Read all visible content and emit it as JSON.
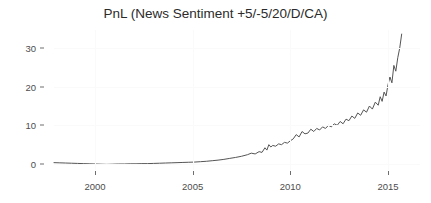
{
  "chart_data": {
    "type": "line",
    "title": "PnL (News Sentiment +5/-5/20/D/CA)",
    "xlabel": "",
    "ylabel": "",
    "xlim": [
      1997.7,
      1
    ],
    "ylim": [
      -1.5,
      35.5
    ],
    "xticks": [
      2000,
      2005,
      2010,
      2015
    ],
    "xtick_labels": [
      "2000",
      "2005",
      "2010",
      "2015"
    ],
    "yticks": [
      0,
      10,
      20,
      30
    ],
    "ytick_labels": [
      "0",
      "10",
      "20",
      "30"
    ],
    "grid": "faint",
    "legend": "none",
    "line_color": "#555555",
    "series": [
      {
        "name": "PnL",
        "x": [
          1997.9,
          1998.2,
          1998.5,
          1998.8,
          1999.1,
          1999.4,
          1999.7,
          2000.0,
          2000.3,
          2000.6,
          2000.9,
          2001.2,
          2001.5,
          2001.8,
          2002.1,
          2002.4,
          2002.7,
          2003.0,
          2003.3,
          2003.6,
          2003.9,
          2004.2,
          2004.5,
          2004.8,
          2005.1,
          2005.4,
          2005.7,
          2006.0,
          2006.3,
          2006.6,
          2006.9,
          2007.2,
          2007.5,
          2007.8,
          2008.0,
          2008.2,
          2008.4,
          2008.55,
          2008.7,
          2008.8,
          2008.9,
          2009.0,
          2009.1,
          2009.25,
          2009.4,
          2009.55,
          2009.7,
          2009.85,
          2010.0,
          2010.15,
          2010.3,
          2010.45,
          2010.6,
          2010.75,
          2010.9,
          2011.05,
          2011.2,
          2011.35,
          2011.5,
          2011.65,
          2011.8,
          2011.95,
          2012.1,
          2012.25,
          2012.4,
          2012.55,
          2012.7,
          2012.85,
          2013.0,
          2013.15,
          2013.3,
          2013.45,
          2013.6,
          2013.75,
          2013.9,
          2014.05,
          2014.2,
          2014.35,
          2014.5,
          2014.6,
          2014.7,
          2014.8,
          2014.9,
          2015.0,
          2015.1,
          2015.2,
          2015.3,
          2015.4,
          2015.5,
          2015.6,
          2015.7
        ],
        "y": [
          0.35,
          0.3,
          0.25,
          0.2,
          0.15,
          0.1,
          0.05,
          0.0,
          -0.05,
          -0.1,
          -0.05,
          0.0,
          0.0,
          0.05,
          0.05,
          0.1,
          0.1,
          0.15,
          0.2,
          0.25,
          0.3,
          0.35,
          0.4,
          0.45,
          0.5,
          0.6,
          0.7,
          0.85,
          1.0,
          1.2,
          1.45,
          1.7,
          2.0,
          2.4,
          2.8,
          2.6,
          3.2,
          3.0,
          4.2,
          3.6,
          5.0,
          4.4,
          4.8,
          4.6,
          5.2,
          5.0,
          5.6,
          5.4,
          6.0,
          6.5,
          7.6,
          7.0,
          8.4,
          7.8,
          8.0,
          9.0,
          8.4,
          9.2,
          8.8,
          9.6,
          9.2,
          10.0,
          9.6,
          10.4,
          10.0,
          11.0,
          10.4,
          11.6,
          11.2,
          12.4,
          11.8,
          13.2,
          12.6,
          14.0,
          13.4,
          15.0,
          14.2,
          16.0,
          15.2,
          17.4,
          16.2,
          18.6,
          17.6,
          20.5,
          22.5,
          21.0,
          25.5,
          24.0,
          27.5,
          30.0,
          33.6
        ]
      }
    ]
  }
}
